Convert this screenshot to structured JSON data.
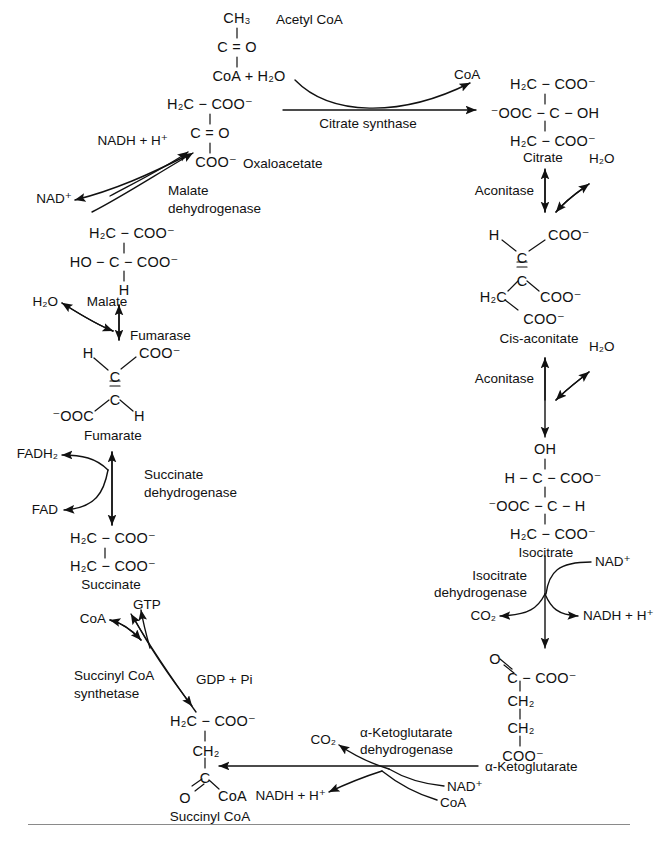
{
  "figure": {
    "line_color": "#111111",
    "rule_color": "#8a8a8a",
    "background": "#ffffff"
  },
  "metabolites": {
    "acetyl_coa": {
      "label": "Acetyl CoA",
      "structure": [
        "CH3",
        "|",
        "C = O",
        "|",
        "CoA + H2O"
      ],
      "lines": {
        "l1": "CH₃",
        "l2": "C = O",
        "l3": "CoA + H₂O"
      }
    },
    "oxaloacetate": {
      "label": "Oxaloacetate",
      "lines": {
        "l1": "H₂C − COO⁻",
        "l2": "C = O",
        "l3": "COO⁻"
      }
    },
    "citrate": {
      "label": "Citrate",
      "lines": {
        "l1": "H₂C − COO⁻",
        "l2": "⁻OOC − C − OH",
        "l3": "H₂C − COO⁻"
      }
    },
    "cis_aconitate": {
      "label": "Cis-aconitate",
      "lines": {
        "h": "H",
        "coo_top": "COO⁻",
        "c_top": "C",
        "c_bot": "C",
        "h2c": "H₂C",
        "coo_mid": "COO⁻",
        "coo_bot": "COO⁻"
      }
    },
    "isocitrate": {
      "label": "Isocitrate",
      "lines": {
        "l0": "OH",
        "l1": "H − C − COO⁻",
        "l2": "⁻OOC − C − H",
        "l3": "H₂C − COO⁻"
      }
    },
    "alpha_ketoglutarate": {
      "label": "α-Ketoglutarate",
      "lines": {
        "o": "O",
        "l1": "C − COO⁻",
        "l2": "CH₂",
        "l3": "CH₂",
        "l4": "COO⁻"
      }
    },
    "succinyl_coa": {
      "label": "Succinyl CoA",
      "lines": {
        "l1": "H₂C − COO⁻",
        "l2": "CH₂",
        "l3": "C",
        "o": "O",
        "coa": "CoA"
      }
    },
    "succinate": {
      "label": "Succinate",
      "lines": {
        "l1": "H₂C − COO⁻",
        "l2": "H₂C − COO⁻"
      }
    },
    "fumarate": {
      "label": "Fumarate",
      "lines": {
        "h_top": "H",
        "coo_top": "COO⁻",
        "c_top": "C",
        "c_bot": "C",
        "ooc": "⁻OOC",
        "h_bot": "H"
      }
    },
    "malate": {
      "label": "Malate",
      "lines": {
        "l1": "H₂C − COO⁻",
        "l2": "HO − C − COO⁻",
        "l3": "H"
      }
    }
  },
  "enzymes": {
    "citrate_synthase": "Citrate synthase",
    "aconitase_1": "Aconitase",
    "aconitase_2": "Aconitase",
    "isocitrate_dehydrogenase_l1": "Isocitrate",
    "isocitrate_dehydrogenase_l2": "dehydrogenase",
    "akg_dehydrogenase_l1": "α-Ketoglutarate",
    "akg_dehydrogenase_l2": "dehydrogenase",
    "succinyl_coa_synthetase_l1": "Succinyl CoA",
    "succinyl_coa_synthetase_l2": "synthetase",
    "succinate_dehydrogenase_l1": "Succinate",
    "succinate_dehydrogenase_l2": "dehydrogenase",
    "fumarase": "Fumarase",
    "malate_dehydrogenase_l1": "Malate",
    "malate_dehydrogenase_l2": "dehydrogenase"
  },
  "cofactors": {
    "coa_citrate_synthase": "CoA",
    "h2o_aconitase_1": "H₂O",
    "h2o_aconitase_2": "H₂O",
    "nad_isocitrate": "NAD⁺",
    "nadh_isocitrate": "NADH + H⁺",
    "co2_isocitrate": "CO₂",
    "nad_akg": "NAD⁺",
    "coa_akg": "CoA",
    "co2_akg": "CO₂",
    "nadh_akg": "NADH + H⁺",
    "coa_succinyl": "CoA",
    "gtp": "GTP",
    "gdp_pi": "GDP + Pi",
    "fadh2": "FADH₂",
    "fad": "FAD",
    "h2o_fumarase": "H₂O",
    "nadh_malate": "NADH + H⁺",
    "nad_malate": "NAD⁺"
  }
}
